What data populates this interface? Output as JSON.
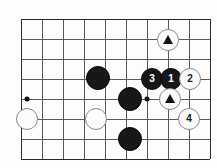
{
  "board": {
    "title": "Go board problem diagram",
    "width": 217,
    "height": 168,
    "cell_size": 21,
    "origin_x": 21,
    "origin_y": 19,
    "cols": 10,
    "rows": 8,
    "colors": {
      "background": "#fdfdfc",
      "line": "#5a5a5a",
      "edge_line": "#2b2b2b",
      "black_stone": "#17171a",
      "white_stone": "#fcfcfc",
      "white_stone_border": "#8a8a8a",
      "marker": "#111111"
    },
    "vertical_lines_x": [
      21,
      42,
      63,
      84,
      105,
      126,
      147,
      168,
      189,
      210
    ],
    "horizontal_lines_y": [
      19,
      39,
      59,
      79,
      99,
      119,
      139,
      159
    ],
    "star_points": [
      {
        "name": "star-point-left",
        "x": 27,
        "y": 99
      },
      {
        "name": "star-point-right",
        "x": 147,
        "y": 99
      }
    ],
    "stones": [
      {
        "name": "white-stone-marked-top",
        "color": "white",
        "x": 168,
        "y": 40,
        "radius": 11,
        "label": "",
        "marker": "triangle"
      },
      {
        "name": "black-stone-move-3",
        "color": "black",
        "x": 152,
        "y": 79,
        "radius": 11,
        "label": "3",
        "marker": ""
      },
      {
        "name": "black-stone-move-1",
        "color": "black",
        "x": 171,
        "y": 79,
        "radius": 11,
        "label": "1",
        "marker": ""
      },
      {
        "name": "white-stone-move-2",
        "color": "white",
        "x": 190,
        "y": 79,
        "radius": 11,
        "label": "2",
        "marker": ""
      },
      {
        "name": "white-stone-marked-center",
        "color": "white",
        "x": 170,
        "y": 99,
        "radius": 11,
        "label": "",
        "marker": "triangle"
      },
      {
        "name": "white-stone-move-4",
        "color": "white",
        "x": 189,
        "y": 119,
        "radius": 11,
        "label": "4",
        "marker": ""
      },
      {
        "name": "black-stone-upper-left",
        "color": "black",
        "x": 98,
        "y": 78,
        "radius": 12,
        "label": "",
        "marker": ""
      },
      {
        "name": "black-stone-center",
        "color": "black",
        "x": 130,
        "y": 99,
        "radius": 12,
        "label": "",
        "marker": ""
      },
      {
        "name": "black-stone-bottom",
        "color": "black",
        "x": 130,
        "y": 139,
        "radius": 12,
        "label": "",
        "marker": ""
      },
      {
        "name": "white-stone-left",
        "color": "white",
        "x": 27,
        "y": 119,
        "radius": 11,
        "label": "",
        "marker": ""
      },
      {
        "name": "white-stone-mid-left",
        "color": "white",
        "x": 96,
        "y": 119,
        "radius": 11,
        "label": "",
        "marker": ""
      }
    ],
    "move_numbers": [
      "1",
      "2",
      "3",
      "4"
    ],
    "marker_symbol": "triangle"
  }
}
